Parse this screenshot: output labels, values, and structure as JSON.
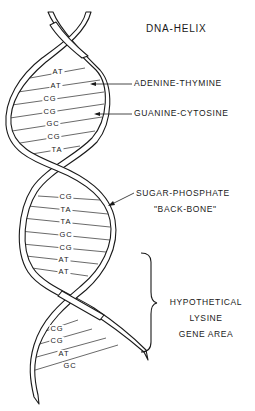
{
  "title": "DNA-HELIX",
  "labels": {
    "adenine_thymine": "ADENINE-THYMINE",
    "guanine_cytosine": "GUANINE-CYTOSINE",
    "sugar_phosphate_line1": "SUGAR-PHOSPHATE",
    "sugar_phosphate_line2": "\"BACK-BONE\"",
    "gene_area_line1": "HYPOTHETICAL",
    "gene_area_line2": "LYSINE",
    "gene_area_line3": "GENE AREA"
  },
  "base_pairs": {
    "upper": [
      "AT",
      "AT",
      "CG",
      "CG",
      "GC",
      "CG",
      "TA"
    ],
    "middle": [
      "CG",
      "TA",
      "TA",
      "GC",
      "CG",
      "AT",
      "AT"
    ],
    "lower": [
      "CG",
      "CG",
      "AT",
      "GC"
    ]
  },
  "colors": {
    "ink": "#1a1a1a",
    "background": "#ffffff"
  }
}
